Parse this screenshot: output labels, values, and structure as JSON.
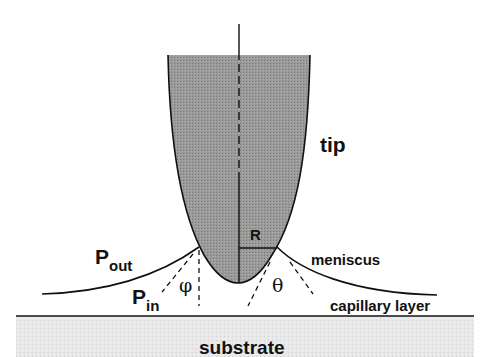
{
  "diagram": {
    "labels": {
      "tip": "tip",
      "radius": "R",
      "p_out_main": "P",
      "p_out_sub": "out",
      "p_in_main": "P",
      "p_in_sub": "in",
      "phi": "φ",
      "theta": "θ",
      "meniscus": "meniscus",
      "capillary_layer": "capillary layer",
      "substrate": "substrate"
    },
    "colors": {
      "tip_fill": "#8f8f8f",
      "substrate_fill": "#e6e6e6",
      "line": "#111111",
      "background": "#ffffff"
    }
  }
}
